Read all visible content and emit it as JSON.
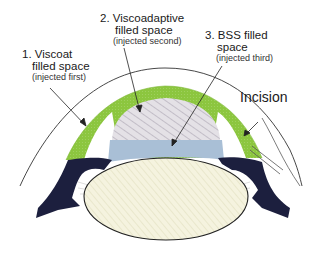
{
  "diagram": {
    "type": "eye cross-section (anterior segment) — soft-shell viscoelastic technique",
    "labels": [
      {
        "id": "viscoat",
        "line1": "1. Viscoat",
        "line2": "filled space",
        "note": "(injected first)"
      },
      {
        "id": "viscoadaptive",
        "line1": "2. Viscoadaptive",
        "line2": "filled space",
        "note": "(injected second)"
      },
      {
        "id": "bss",
        "line1": "3. BSS filled",
        "line2": "space",
        "note": "(injected third)"
      },
      {
        "id": "incision",
        "line1": "Incision"
      }
    ],
    "colors": {
      "viscoat": "#8cc63f",
      "viscoadaptive": "#d8d4dc",
      "bss": "#a9bfd6",
      "iris": "#1c1f3e",
      "lens": "#f3f1dc",
      "outline": "#222222"
    }
  }
}
